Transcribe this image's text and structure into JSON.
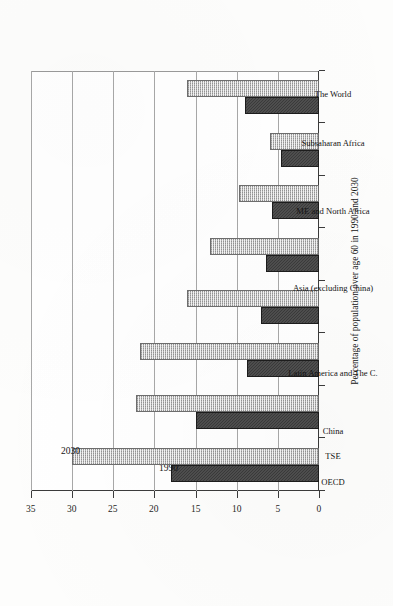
{
  "chart_data": {
    "type": "bar",
    "orientation": "vertical-printed-sideways",
    "title": "",
    "xlabel": "",
    "ylabel": "Percentage of population over age 60 in 1990 and 2030",
    "ylim": [
      0,
      35
    ],
    "yticks": [
      0,
      5,
      10,
      15,
      20,
      25,
      30,
      35
    ],
    "grid": true,
    "legend": "inline-labels-on-first-group",
    "categories": [
      "OECD",
      "TSE",
      "China",
      "Latin America and The C.",
      "Asia (excluding China)",
      "ME and North Africa",
      "Subsaharan Africa",
      "The World"
    ],
    "series": [
      {
        "name": "1990",
        "color": "#3a3a3a",
        "values": [
          18.0,
          15.0,
          8.8,
          7.0,
          6.4,
          5.7,
          4.6,
          9.0
        ]
      },
      {
        "name": "2030",
        "color": "#b7b7b7",
        "values": [
          30.0,
          22.3,
          21.8,
          16.0,
          13.2,
          9.7,
          5.9,
          16.0
        ]
      }
    ]
  },
  "axis": {
    "value_axis_title": "Percentage of population over age 60 in 1990 and 2030",
    "tick_labels": [
      "0",
      "5",
      "10",
      "15",
      "20",
      "25",
      "30",
      "35"
    ]
  },
  "series_tags": {
    "s1990": "1990",
    "s2030": "2030"
  }
}
